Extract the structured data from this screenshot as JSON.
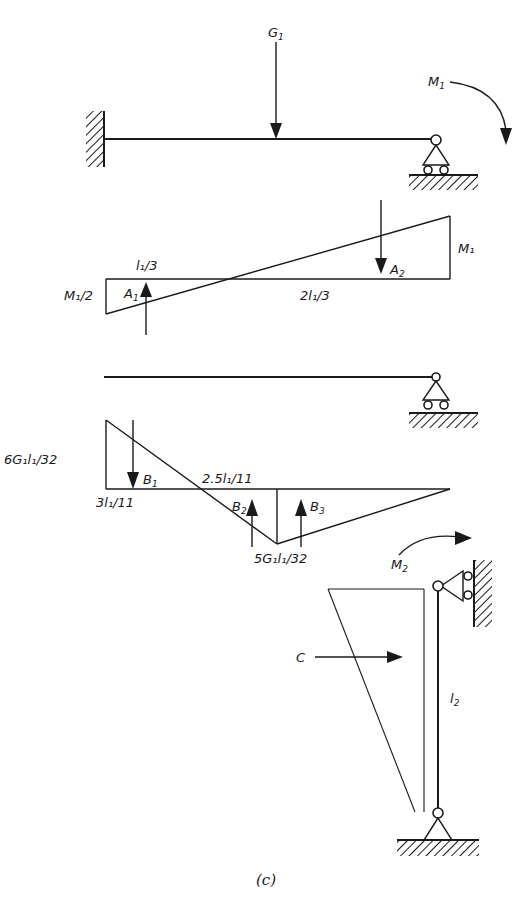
{
  "figure": {
    "caption": "(c)"
  },
  "beam1": {
    "load_label": "G",
    "load_sub": "1",
    "moment_label": "M",
    "moment_sub": "1"
  },
  "moment_diagram_A": {
    "left_value": "M₁/2",
    "right_value": "M₁",
    "segment_left": "l₁/3",
    "segment_right": "2l₁/3",
    "area1_label": "A",
    "area1_sub": "1",
    "area2_label": "A",
    "area2_sub": "2"
  },
  "moment_diagram_B": {
    "left_value": "6G₁l₁/32",
    "bottom_value": "5G₁l₁/32",
    "x1_label": "3l₁/11",
    "x2_label": "2.5l₁/11",
    "area1_label": "B",
    "area1_sub": "1",
    "area2_label": "B",
    "area2_sub": "2",
    "area3_label": "B",
    "area3_sub": "3"
  },
  "column": {
    "moment_label": "M",
    "moment_sub": "2",
    "length_label": "l",
    "length_sub": "2",
    "area_label": "C"
  }
}
